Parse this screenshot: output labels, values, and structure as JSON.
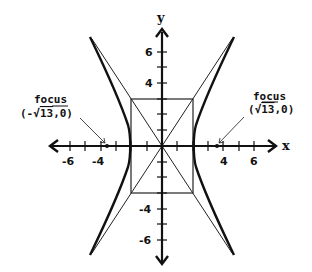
{
  "diagram": {
    "axes": {
      "x_label": "x",
      "y_label": "y",
      "x_ticks": [
        "-6",
        "-4",
        "4",
        "6"
      ],
      "y_ticks": [
        "6",
        "4",
        "-4",
        "-6"
      ],
      "x_range": [
        -7,
        7
      ],
      "y_range": [
        -7,
        7
      ]
    },
    "foci": {
      "left": {
        "title": "focus",
        "coord_prefix": "(-",
        "radicand": "13",
        "coord_suffix": ",0)",
        "x": -3.606,
        "y": 0
      },
      "right": {
        "title": "focus",
        "coord_prefix": "(",
        "radicand": "13",
        "coord_suffix": ",0)",
        "x": 3.606,
        "y": 0
      }
    },
    "rectangle": {
      "x_min": -2,
      "x_max": 2,
      "y_min": -3,
      "y_max": 3
    },
    "asymptotes": [
      "y = 1.5x",
      "y = -1.5x"
    ],
    "hyperbola": {
      "a": 2,
      "b": 3,
      "orientation": "horizontal"
    },
    "colors": {
      "ink": "#111111",
      "background": "#ffffff"
    }
  }
}
